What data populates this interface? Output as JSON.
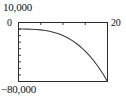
{
  "chart_data": {
    "type": "line",
    "title": "",
    "subtitle": "",
    "xlabel": "",
    "ylabel": "",
    "xlim": [
      0,
      20
    ],
    "ylim": [
      -80000,
      10000
    ],
    "grid": false,
    "legend": null,
    "x_axis_position": "top",
    "y_tick_labels": [
      "10,000",
      "-80,000"
    ],
    "x_tick_labels": [
      "0",
      "20"
    ],
    "x_minor_ticks": [
      5,
      10,
      15,
      20
    ],
    "series": [
      {
        "name": "curve",
        "color": "#3a3a3a",
        "x": [
          0,
          1,
          2,
          3,
          4,
          5,
          6,
          7,
          8,
          9,
          10,
          11,
          12,
          13,
          14,
          15,
          16,
          17,
          18,
          19,
          20
        ],
        "values": [
          0,
          -10,
          -80,
          -270,
          -640,
          -1250,
          -2160,
          -3430,
          -5120,
          -7290,
          -10000,
          -13310,
          -17280,
          -21970,
          -27440,
          -33750,
          -40960,
          -49130,
          -58320,
          -68590,
          -80000
        ]
      }
    ]
  },
  "labels": {
    "y_max": "10,000",
    "y_min": "−80,000",
    "y_origin": "0",
    "x_max": "20"
  }
}
